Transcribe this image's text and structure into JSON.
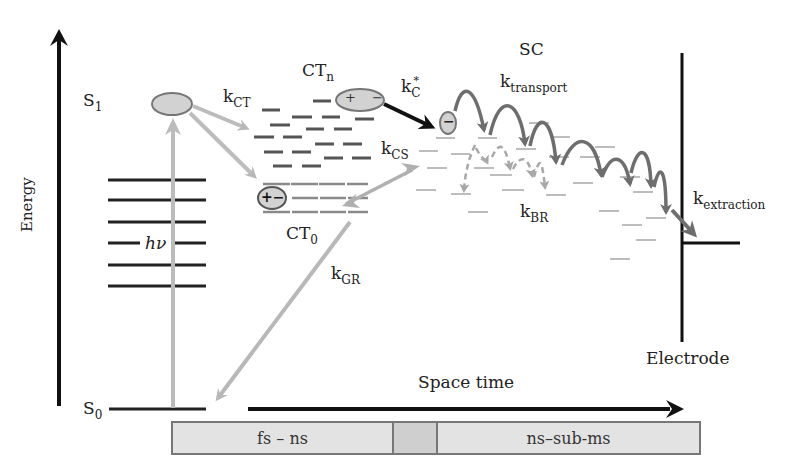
{
  "diagram": {
    "axis": {
      "energy_label": "Energy",
      "space_time_label": "Space time"
    },
    "states": {
      "s1": {
        "main": "S",
        "sub": "1"
      },
      "s0": {
        "main": "S",
        "sub": "0"
      },
      "ctn": {
        "main": "CT",
        "sub": "n"
      },
      "ct0": {
        "main": "CT",
        "sub": "0"
      },
      "sc": "SC",
      "electrode": "Electrode",
      "hv": "hν"
    },
    "rates": {
      "k_ct": {
        "main": "k",
        "sub": "CT"
      },
      "k_c_star": {
        "main": "k",
        "sub": "C",
        "sup": "*"
      },
      "k_cs": {
        "main": "k",
        "sub": "CS"
      },
      "k_gr": {
        "main": "k",
        "sub": "GR"
      },
      "k_br": {
        "main": "k",
        "sub": "BR"
      },
      "k_transport": {
        "main": "k",
        "sub": "transport"
      },
      "k_extraction": {
        "main": "k",
        "sub": "extraction"
      }
    },
    "charges": {
      "ctn_pair": "+ −",
      "ct0_pair": "+−",
      "free_electron": "−"
    },
    "timescale_bar": [
      {
        "label": "fs – ns"
      },
      {
        "label": ""
      },
      {
        "label": "ns–sub-ms"
      }
    ],
    "colors": {
      "black": "#111111",
      "light_gray_arrow": "#b8b8b8",
      "mid_gray_arrow": "#6e6e6e",
      "ellipse_fill": "#d2d2d2",
      "level_dark": "#555555",
      "level_light": "#bdbdbd"
    }
  }
}
